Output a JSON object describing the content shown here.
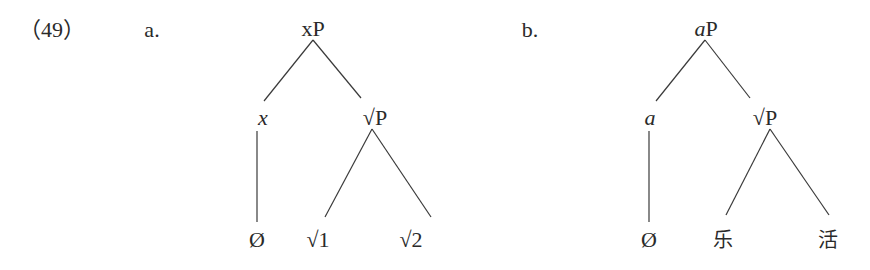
{
  "example": {
    "number": "（49）"
  },
  "trees": [
    {
      "label": "a.",
      "root": {
        "head": "x",
        "suffix": "P"
      },
      "left": {
        "label": "x"
      },
      "right": {
        "root_sym": "√",
        "suffix": "P"
      },
      "leaves": [
        "Ø",
        "√1",
        "√2"
      ]
    },
    {
      "label": "b.",
      "root": {
        "head": "a",
        "suffix": "P"
      },
      "left": {
        "label": "a"
      },
      "right": {
        "root_sym": "√",
        "suffix": "P"
      },
      "leaves": [
        "Ø",
        "乐",
        "活"
      ]
    }
  ],
  "colors": {
    "text": "#2a2a2a",
    "lines": "#3a3a3a",
    "background": "#ffffff"
  }
}
